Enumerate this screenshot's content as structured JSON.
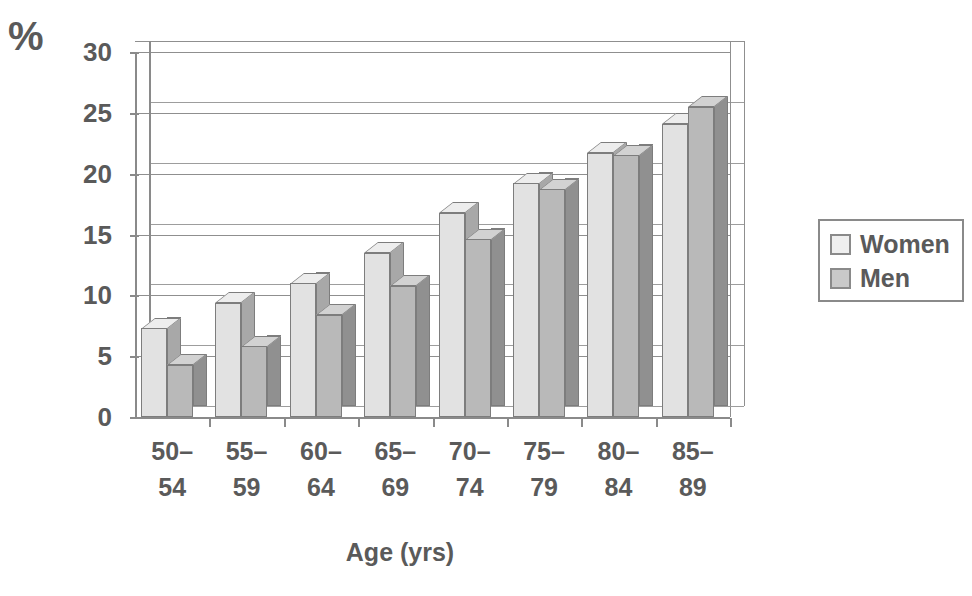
{
  "chart_data": {
    "type": "bar",
    "title": "",
    "xlabel": "Age (yrs)",
    "ylabel": "%",
    "categories": [
      "50–54",
      "55–59",
      "60–64",
      "65–69",
      "70–74",
      "75–79",
      "80–84",
      "85–89"
    ],
    "series": [
      {
        "name": "Women",
        "values": [
          7.3,
          9.4,
          11.0,
          13.5,
          16.8,
          19.2,
          21.7,
          24.1
        ],
        "color": "#e2e2e2"
      },
      {
        "name": "Men",
        "values": [
          4.3,
          5.8,
          8.4,
          10.8,
          14.6,
          18.7,
          21.5,
          25.5
        ],
        "color": "#b9b9b9"
      }
    ],
    "ylim": [
      0,
      30
    ],
    "yticks": [
      0,
      5,
      10,
      15,
      20,
      25,
      30
    ],
    "ytick_labels": [
      "0",
      "5",
      "10",
      "15",
      "20",
      "25",
      "30"
    ],
    "grid": true,
    "grid_axis": "y",
    "legend_position": "right",
    "style_3d": true
  },
  "axes": {
    "y_unit_label": "%",
    "x_title": "Age (yrs)"
  },
  "legend": {
    "entries": [
      {
        "label": "Women",
        "swatch": "light-gray"
      },
      {
        "label": "Men",
        "swatch": "medium-gray"
      }
    ]
  },
  "colors": {
    "women_bar": "#e2e2e2",
    "men_bar": "#b9b9b9",
    "axis": "#8a8a8a",
    "text": "#5a5a5a",
    "background": "#ffffff"
  }
}
